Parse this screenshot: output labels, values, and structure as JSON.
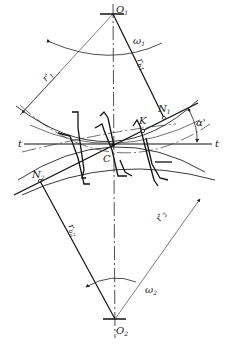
{
  "diagram": {
    "type": "gear-meshing-geometry",
    "colors": {
      "line": "#222222",
      "thin": "#444444",
      "background": "#ffffff"
    },
    "points": {
      "O1": {
        "label": "O",
        "sub": "1",
        "x": 113,
        "y": 10
      },
      "O2": {
        "label": "O",
        "sub": "2",
        "x": 115,
        "y": 323
      },
      "C": {
        "label": "C",
        "x": 113,
        "y": 146
      },
      "K": {
        "label": "K",
        "x": 143,
        "y": 131
      },
      "N1": {
        "label": "N",
        "sub": "1",
        "x": 164,
        "y": 118
      },
      "N2": {
        "label": "N",
        "sub": "2",
        "x": 40,
        "y": 181
      }
    },
    "labels": {
      "omega1": {
        "text": "ω",
        "sub": "1"
      },
      "omega2": {
        "text": "ω",
        "sub": "2"
      },
      "r1_prime": {
        "text": "r'",
        "sub": "1"
      },
      "r2_prime": {
        "text": "r'",
        "sub": "2"
      },
      "rb1": {
        "text": "r",
        "sub": "b1"
      },
      "rb2": {
        "text": "r",
        "sub": "b2"
      },
      "alpha_prime": {
        "text": "α'"
      },
      "t_left": {
        "text": "t"
      },
      "t_right": {
        "text": "t"
      }
    }
  }
}
